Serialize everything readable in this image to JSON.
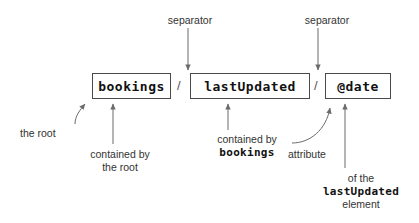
{
  "diagram": {
    "colors": {
      "background": "#ffffff",
      "box_border": "#4a4a4a",
      "box_fill": "#ffffff",
      "arrow": "#6b6b6b",
      "text": "#333333",
      "code_text": "#111111"
    },
    "nodes": [
      {
        "id": "bookings",
        "label": "bookings",
        "x": 92,
        "y": 73,
        "w": 79,
        "h": 26
      },
      {
        "id": "lastUpdated",
        "label": "lastUpdated",
        "x": 190,
        "y": 73,
        "w": 120,
        "h": 26
      },
      {
        "id": "date",
        "label": "@date",
        "x": 325,
        "y": 73,
        "w": 66,
        "h": 26
      }
    ],
    "separators": [
      {
        "id": "sep-1",
        "label": "/",
        "x": 177,
        "y": 79
      },
      {
        "id": "sep-2",
        "label": "/",
        "x": 314,
        "y": 79
      }
    ],
    "annotations": [
      {
        "id": "separator-top-left",
        "lines": [
          "separator"
        ],
        "x": 155,
        "y": 14,
        "align": "center",
        "width": 70
      },
      {
        "id": "separator-top-right",
        "lines": [
          "separator"
        ],
        "x": 292,
        "y": 14,
        "align": "center",
        "width": 70
      },
      {
        "id": "the-root",
        "lines": [
          "the root"
        ],
        "x": 20,
        "y": 127,
        "align": "left",
        "width": 60
      },
      {
        "id": "contained-by-the-root",
        "lines": [
          "contained by",
          "the root"
        ],
        "x": 78,
        "y": 148,
        "align": "center",
        "width": 84
      },
      {
        "id": "contained-by-bookings",
        "lines": [
          "contained by",
          "bookings"
        ],
        "x": 192,
        "y": 133,
        "align": "center",
        "width": 110,
        "mono_lines": [
          1
        ]
      },
      {
        "id": "attribute",
        "lines": [
          "attribute"
        ],
        "x": 288,
        "y": 148,
        "align": "left",
        "width": 58
      },
      {
        "id": "of-the-lastUpdated-element",
        "lines": [
          "of the",
          "lastUpdated",
          "element"
        ],
        "x": 305,
        "y": 172,
        "align": "center",
        "width": 112,
        "mono_lines": [
          1
        ]
      }
    ]
  }
}
